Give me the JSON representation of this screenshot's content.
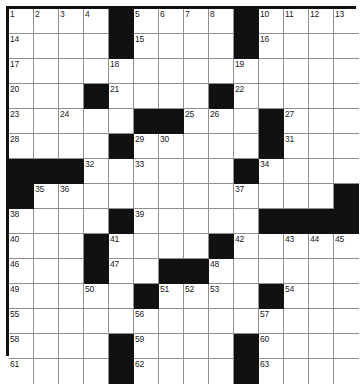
{
  "puzzle": {
    "title": "Crossword Puzzle Grid",
    "type": "crossword",
    "columns": 14,
    "rows": 14,
    "cell_size_px": 25,
    "colors": {
      "block": "#111111",
      "cell": "#ffffff",
      "gridline": "#8f8f8f",
      "border": "#111111",
      "number_text": "#1a1a1a"
    },
    "legend": {
      "filled_symbol": "black-square",
      "open_symbol": "white-square"
    },
    "grid": [
      [
        "1",
        "2",
        "3",
        "4",
        "#",
        "5",
        "6",
        "7",
        "8",
        "9",
        "#",
        "10",
        "11",
        "12"
      ],
      [
        "14",
        "",
        "",
        "",
        "#",
        "15",
        "",
        "",
        "",
        "",
        "#",
        "16",
        "",
        "",
        ""
      ],
      [
        "17",
        "",
        "",
        "18",
        "",
        "",
        "",
        "",
        "19",
        "",
        "",
        "",
        "",
        ""
      ],
      [
        "20",
        "",
        "",
        "#",
        "21",
        "",
        "",
        "",
        "#",
        "22",
        "",
        "",
        "",
        ""
      ],
      [
        "23",
        "",
        "24",
        "",
        "",
        "#",
        "#",
        "25",
        "26",
        "",
        "#",
        "27",
        "",
        ""
      ],
      [
        "28",
        "",
        "",
        "",
        "",
        "#",
        "29",
        "30",
        "",
        "",
        "",
        "#",
        "31",
        ""
      ],
      [
        "#",
        "#",
        "#",
        "32",
        "",
        "33",
        "",
        "",
        "",
        "",
        "#",
        "34",
        "",
        ""
      ],
      [
        "#",
        "35",
        "36",
        "",
        "",
        "",
        "",
        "",
        "",
        "37",
        "",
        "",
        "",
        "#"
      ],
      [
        "38",
        "",
        "",
        "",
        "#",
        "39",
        "",
        "",
        "",
        "",
        "#",
        "#",
        "#",
        "#"
      ],
      [
        "40",
        "",
        "",
        "#",
        "41",
        "",
        "",
        "",
        "#",
        "42",
        "",
        "43",
        "44",
        "45"
      ],
      [
        "46",
        "",
        "",
        "#",
        "47",
        "",
        "#",
        "#",
        "48",
        "",
        "",
        "",
        "",
        ""
      ],
      [
        "49",
        "",
        "",
        "50",
        "",
        "#",
        "51",
        "52",
        "53",
        "",
        "#",
        "54",
        "",
        ""
      ],
      [
        "55",
        "",
        "",
        "",
        "",
        "56",
        "",
        "",
        "",
        "",
        "57",
        "",
        "",
        ""
      ],
      [
        "58",
        "",
        "",
        "",
        "#",
        "59",
        "",
        "",
        "",
        "",
        "60",
        "",
        "",
        ""
      ],
      [
        "61",
        "",
        "",
        "",
        "#",
        "62",
        "",
        "",
        "",
        "",
        "63",
        "",
        "",
        ""
      ]
    ],
    "clue_numbers_visible": [
      "1",
      "2",
      "3",
      "4",
      "5",
      "6",
      "7",
      "8",
      "9",
      "10",
      "11",
      "12",
      "13",
      "14",
      "15",
      "16",
      "17",
      "18",
      "19",
      "20",
      "21",
      "22",
      "23",
      "24",
      "25",
      "26",
      "27",
      "28",
      "29",
      "30",
      "31",
      "32",
      "33",
      "34",
      "35",
      "36",
      "37",
      "38",
      "39",
      "40",
      "41",
      "42",
      "43",
      "44",
      "45",
      "46",
      "47",
      "48",
      "49",
      "50",
      "51",
      "52",
      "53",
      "54",
      "55",
      "56",
      "57",
      "58",
      "59",
      "60",
      "61",
      "62",
      "63"
    ],
    "layout": [
      {
        "row": 1,
        "blocks": [
          5,
          10
        ],
        "numbers": {
          "1": 1,
          "2": 2,
          "3": 3,
          "4": 4,
          "6": 5,
          "7": 6,
          "8": 7,
          "9": 8,
          "10": 9,
          "11": 10,
          "12": 11,
          "13": 12,
          "14": 13
        }
      },
      {
        "row": 2,
        "blocks": [
          5,
          10
        ],
        "numbers": {
          "1": 14,
          "6": 15,
          "11": 16
        }
      },
      {
        "row": 3,
        "blocks": [],
        "numbers": {
          "1": 17,
          "5": 18,
          "10": 19
        }
      },
      {
        "row": 4,
        "blocks": [
          4,
          9
        ],
        "numbers": {
          "1": 20,
          "5": 21,
          "10": 22
        }
      },
      {
        "row": 5,
        "blocks": [
          6,
          7,
          11
        ],
        "numbers": {
          "1": 23,
          "3": 24,
          "8": 25,
          "9": 26,
          "12": 27
        }
      },
      {
        "row": 6,
        "blocks": [
          5,
          11
        ],
        "numbers": {
          "1": 28,
          "6": 29,
          "7": 30,
          "12": 31
        }
      },
      {
        "row": 7,
        "blocks": [
          1,
          2,
          3,
          10
        ],
        "numbers": {
          "4": 32,
          "6": 33,
          "11": 34
        }
      },
      {
        "row": 8,
        "blocks": [
          1,
          14
        ],
        "numbers": {
          "2": 35,
          "3": 36,
          "10": 37
        }
      },
      {
        "row": 9,
        "blocks": [
          5,
          11,
          12,
          13,
          14
        ],
        "numbers": {
          "1": 38,
          "6": 39
        }
      },
      {
        "row": 10,
        "blocks": [
          4,
          9
        ],
        "numbers": {
          "1": 40,
          "5": 41,
          "10": 42,
          "12": 43,
          "13": 44,
          "14": 45
        }
      },
      {
        "row": 11,
        "blocks": [
          4,
          7,
          8
        ],
        "numbers": {
          "1": 46,
          "5": 47,
          "9": 48
        }
      },
      {
        "row": 12,
        "blocks": [
          6,
          11
        ],
        "numbers": {
          "1": 49,
          "4": 50,
          "7": 51,
          "8": 52,
          "9": 53,
          "12": 54
        }
      },
      {
        "row": 13,
        "blocks": [],
        "numbers": {
          "1": 55,
          "6": 56,
          "11": 57
        }
      },
      {
        "row": 14,
        "blocks": [
          5,
          10
        ],
        "numbers": {
          "1": 58,
          "6": 59,
          "11": 60
        }
      },
      {
        "row": 15,
        "blocks": [
          5,
          10
        ],
        "numbers": {
          "1": 61,
          "6": 62,
          "11": 63
        }
      }
    ]
  }
}
